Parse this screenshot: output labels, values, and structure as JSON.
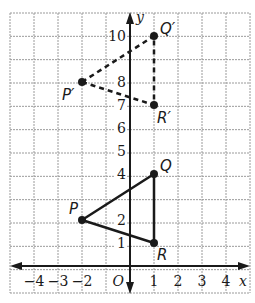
{
  "diagram": {
    "type": "coordinate-plane",
    "grid": {
      "x_min": -5,
      "x_max": 5,
      "y_min": -1,
      "y_max": 11,
      "color": "#9a9a9a"
    },
    "axes": {
      "x_label": "x",
      "y_label": "y",
      "origin_label": "O",
      "x_ticks": [
        {
          "value": -4,
          "label": "−4"
        },
        {
          "value": -3,
          "label": "−3"
        },
        {
          "value": -2,
          "label": "−2"
        },
        {
          "value": 1,
          "label": "1"
        },
        {
          "value": 2,
          "label": "2"
        },
        {
          "value": 3,
          "label": "3"
        },
        {
          "value": 4,
          "label": "4"
        }
      ],
      "y_ticks": [
        {
          "value": 1,
          "label": "1"
        },
        {
          "value": 2,
          "label": "2"
        },
        {
          "value": 4,
          "label": "4"
        },
        {
          "value": 5,
          "label": "5"
        },
        {
          "value": 6,
          "label": "6"
        },
        {
          "value": 7,
          "label": "7"
        },
        {
          "value": 8,
          "label": "8"
        },
        {
          "value": 10,
          "label": "10"
        }
      ]
    },
    "original_triangle": {
      "style": "solid",
      "points": [
        {
          "name": "P",
          "x": -2,
          "y": 2
        },
        {
          "name": "Q",
          "x": 1,
          "y": 4
        },
        {
          "name": "R",
          "x": 1,
          "y": 1
        }
      ]
    },
    "image_triangle": {
      "style": "dashed",
      "points": [
        {
          "name": "P′",
          "x": -2,
          "y": 8
        },
        {
          "name": "Q′",
          "x": 1,
          "y": 10
        },
        {
          "name": "R′",
          "x": 1,
          "y": 7
        }
      ]
    },
    "colors": {
      "ink": "#1a1a1a",
      "grid": "#9a9a9a",
      "background": "#ffffff"
    }
  }
}
